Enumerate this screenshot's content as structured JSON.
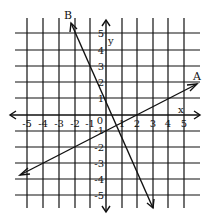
{
  "figure": {
    "x_axis_label": "x",
    "y_axis_label": "y",
    "x_ticks": [
      "-5",
      "-4",
      "-3",
      "-2",
      "-1",
      "0",
      "1",
      "2",
      "3",
      "4",
      "5"
    ],
    "y_ticks": [
      "5",
      "4",
      "3",
      "2",
      "1",
      "-1",
      "-2",
      "-3",
      "-4",
      "-5"
    ],
    "lines": [
      {
        "label": "A",
        "equation": "y = x/2 - 1",
        "through": [
          [
            0,
            -1
          ],
          [
            2,
            0
          ]
        ]
      },
      {
        "label": "B",
        "equation": "y = -2x + 1",
        "through": [
          [
            0,
            1
          ],
          [
            -2,
            5
          ],
          [
            3,
            -5
          ]
        ]
      }
    ],
    "colors": {
      "ink": "#111111",
      "background": "#ffffff"
    }
  }
}
